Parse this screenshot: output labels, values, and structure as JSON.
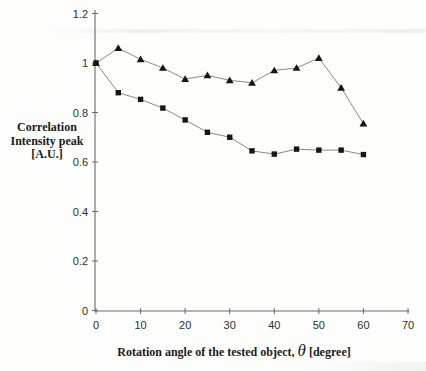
{
  "figure": {
    "y_axis_title_lines": [
      "Correlation",
      "Intensity peak",
      "[A.U.]"
    ],
    "x_title": {
      "prefix": "Rotation angle of the tested object,",
      "theta": "θ",
      "suffix": "[degree]"
    }
  },
  "chart_data": {
    "type": "line",
    "title": "",
    "xlabel": "Rotation angle of the tested object, θ [degree]",
    "ylabel": "Correlation Intensity peak [A.U.]",
    "x": [
      0,
      5,
      10,
      15,
      20,
      25,
      30,
      35,
      40,
      45,
      50,
      55,
      60
    ],
    "series": [
      {
        "name": "triangle-series",
        "marker": "triangle",
        "values": [
          1.0,
          1.06,
          1.015,
          0.98,
          0.935,
          0.95,
          0.93,
          0.92,
          0.97,
          0.98,
          1.02,
          0.9,
          0.755
        ]
      },
      {
        "name": "square-series",
        "marker": "square",
        "values": [
          1.0,
          0.88,
          0.853,
          0.818,
          0.77,
          0.72,
          0.7,
          0.645,
          0.632,
          0.652,
          0.648,
          0.648,
          0.63
        ]
      }
    ],
    "xlim": [
      0,
      70
    ],
    "ylim": [
      0,
      1.2
    ],
    "x_ticks": [
      0,
      10,
      20,
      30,
      40,
      50,
      60,
      70
    ],
    "x_tick_labels": [
      "0",
      "10",
      "20",
      "30",
      "40",
      "50",
      "60",
      "70"
    ],
    "y_ticks": [
      0,
      0.2,
      0.4,
      0.6,
      0.8,
      1,
      1.2
    ],
    "y_tick_labels": [
      "0",
      "0.2",
      "0.4",
      "0.6",
      "0.8",
      "1",
      "1.2"
    ],
    "grid": false,
    "legend": "none",
    "colors": {
      "axis": "#6b6b6b",
      "line": "#8a8a8a",
      "marker": "#161616",
      "tick_text": "#2e2e2e"
    }
  }
}
